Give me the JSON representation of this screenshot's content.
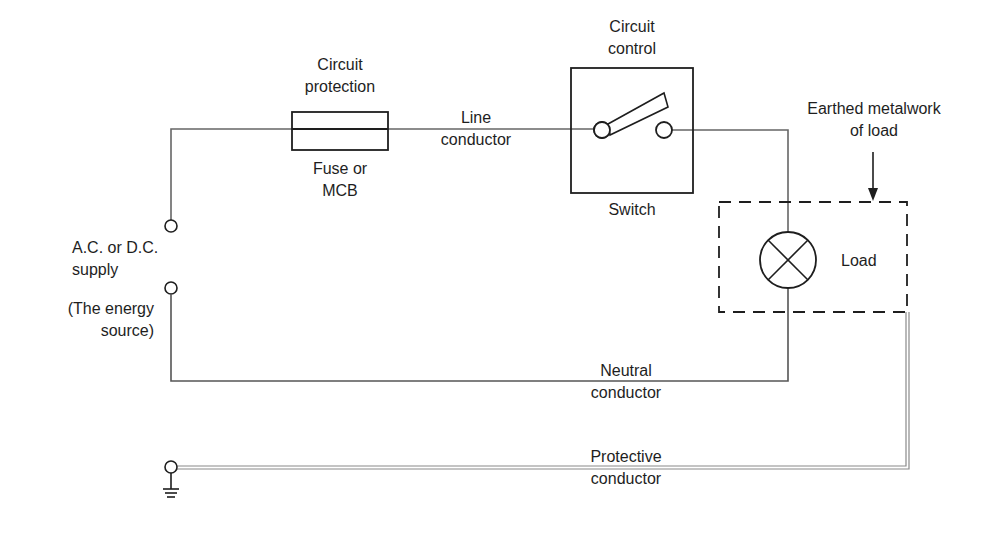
{
  "diagram": {
    "type": "circuit",
    "labels": {
      "fuse_top": [
        "Circuit",
        "protection"
      ],
      "fuse_bottom": [
        "Fuse or",
        "MCB"
      ],
      "line": [
        "Line",
        "conductor"
      ],
      "switch_top": [
        "Circuit",
        "control"
      ],
      "switch_bottom": "Switch",
      "earthed": [
        "Earthed metalwork",
        "of load"
      ],
      "load": "Load",
      "supply": [
        "A.C. or D.C.",
        "supply"
      ],
      "energy": [
        "(The energy",
        "source)"
      ],
      "neutral": [
        "Neutral",
        "conductor"
      ],
      "protective": [
        "Protective",
        "conductor"
      ]
    },
    "components": [
      {
        "id": "supply",
        "name": "A.C. or D.C. supply"
      },
      {
        "id": "fuse",
        "name": "Fuse or MCB"
      },
      {
        "id": "switch",
        "name": "Switch"
      },
      {
        "id": "lamp",
        "name": "Load"
      },
      {
        "id": "earth",
        "name": "Earth terminal"
      }
    ],
    "colors": {
      "wire": "#555555",
      "outline": "#1e1e1e",
      "protective": "#8a8a8a"
    }
  }
}
